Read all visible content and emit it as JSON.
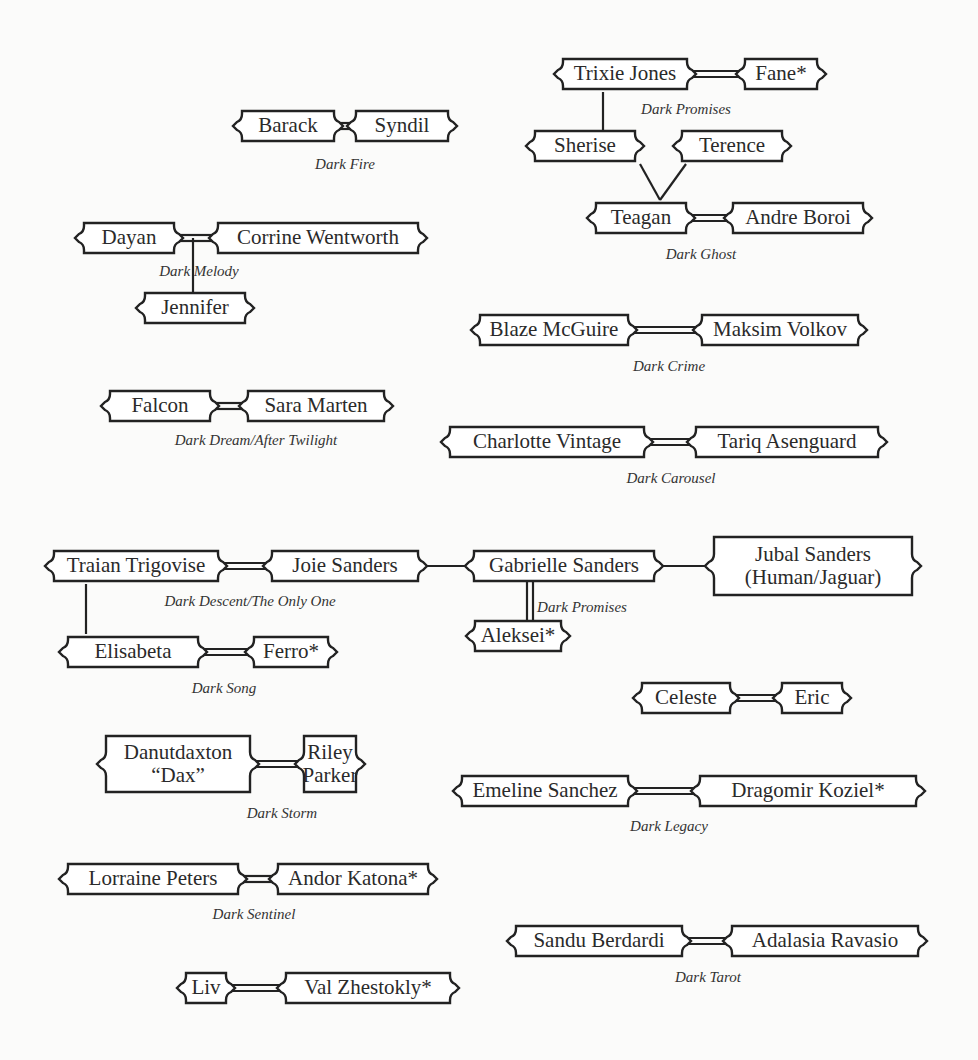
{
  "diagram": {
    "type": "family-relationship-chart",
    "colors": {
      "background": "#fbfbfa",
      "stroke": "#222222",
      "text": "#2a2a2a"
    },
    "nodes": [
      {
        "id": "barack",
        "label": "Barack",
        "x": 232,
        "y": 108,
        "w": 112,
        "h": 36
      },
      {
        "id": "syndil",
        "label": "Syndil",
        "x": 346,
        "y": 108,
        "w": 112,
        "h": 36
      },
      {
        "id": "trixie",
        "label": "Trixie Jones",
        "x": 553,
        "y": 56,
        "w": 144,
        "h": 36
      },
      {
        "id": "fane",
        "label": "Fane*",
        "x": 735,
        "y": 56,
        "w": 92,
        "h": 36
      },
      {
        "id": "sherise",
        "label": "Sherise",
        "x": 525,
        "y": 128,
        "w": 120,
        "h": 36
      },
      {
        "id": "terence",
        "label": "Terence",
        "x": 672,
        "y": 128,
        "w": 120,
        "h": 36
      },
      {
        "id": "teagan",
        "label": "Teagan",
        "x": 586,
        "y": 200,
        "w": 110,
        "h": 36
      },
      {
        "id": "andre",
        "label": "Andre Boroi",
        "x": 723,
        "y": 200,
        "w": 150,
        "h": 36
      },
      {
        "id": "dayan",
        "label": "Dayan",
        "x": 74,
        "y": 220,
        "w": 110,
        "h": 36
      },
      {
        "id": "corrine",
        "label": "Corrine Wentworth",
        "x": 208,
        "y": 220,
        "w": 220,
        "h": 36
      },
      {
        "id": "jennifer",
        "label": "Jennifer",
        "x": 135,
        "y": 290,
        "w": 120,
        "h": 36
      },
      {
        "id": "blaze",
        "label": "Blaze McGuire",
        "x": 470,
        "y": 312,
        "w": 168,
        "h": 36
      },
      {
        "id": "maksim",
        "label": "Maksim Volkov",
        "x": 692,
        "y": 312,
        "w": 176,
        "h": 36
      },
      {
        "id": "falcon",
        "label": "Falcon",
        "x": 100,
        "y": 388,
        "w": 120,
        "h": 36
      },
      {
        "id": "sara",
        "label": "Sara Marten",
        "x": 238,
        "y": 388,
        "w": 156,
        "h": 36
      },
      {
        "id": "charlotte",
        "label": "Charlotte Vintage",
        "x": 440,
        "y": 424,
        "w": 214,
        "h": 36
      },
      {
        "id": "tariq",
        "label": "Tariq Asenguard",
        "x": 686,
        "y": 424,
        "w": 202,
        "h": 36
      },
      {
        "id": "traian",
        "label": "Traian Trigovise",
        "x": 44,
        "y": 548,
        "w": 184,
        "h": 36
      },
      {
        "id": "joie",
        "label": "Joie Sanders",
        "x": 262,
        "y": 548,
        "w": 166,
        "h": 36
      },
      {
        "id": "gabrielle",
        "label": "Gabrielle Sanders",
        "x": 464,
        "y": 548,
        "w": 200,
        "h": 36
      },
      {
        "id": "jubal",
        "label": "Jubal Sanders (Human/Jaguar)",
        "lines": [
          "Jubal Sanders",
          "(Human/Jaguar)"
        ],
        "x": 704,
        "y": 534,
        "w": 218,
        "h": 64
      },
      {
        "id": "elisabeta",
        "label": "Elisabeta",
        "x": 58,
        "y": 634,
        "w": 150,
        "h": 36
      },
      {
        "id": "ferro",
        "label": "Ferro*",
        "x": 244,
        "y": 634,
        "w": 94,
        "h": 36
      },
      {
        "id": "aleksei",
        "label": "Aleksei*",
        "x": 465,
        "y": 618,
        "w": 106,
        "h": 36
      },
      {
        "id": "celeste",
        "label": "Celeste",
        "x": 632,
        "y": 680,
        "w": 108,
        "h": 36
      },
      {
        "id": "eric",
        "label": "Eric",
        "x": 772,
        "y": 680,
        "w": 80,
        "h": 36
      },
      {
        "id": "danutdaxton",
        "label": "Danutdaxton “Dax”",
        "lines": [
          "Danutdaxton",
          "“Dax”"
        ],
        "x": 96,
        "y": 733,
        "w": 164,
        "h": 62
      },
      {
        "id": "riley",
        "label": "Riley Parker",
        "lines": [
          "Riley",
          "Parker"
        ],
        "x": 294,
        "y": 733,
        "w": 72,
        "h": 62
      },
      {
        "id": "emeline",
        "label": "Emeline Sanchez",
        "x": 452,
        "y": 773,
        "w": 186,
        "h": 36
      },
      {
        "id": "dragomir",
        "label": "Dragomir Koziel*",
        "x": 690,
        "y": 773,
        "w": 236,
        "h": 36
      },
      {
        "id": "lorraine",
        "label": "Lorraine Peters",
        "x": 58,
        "y": 861,
        "w": 190,
        "h": 36
      },
      {
        "id": "andor",
        "label": "Andor Katona*",
        "x": 268,
        "y": 861,
        "w": 170,
        "h": 36
      },
      {
        "id": "sandu",
        "label": "Sandu Berdardi",
        "x": 506,
        "y": 923,
        "w": 186,
        "h": 36
      },
      {
        "id": "adalasia",
        "label": "Adalasia Ravasio",
        "x": 722,
        "y": 923,
        "w": 206,
        "h": 36
      },
      {
        "id": "liv",
        "label": "Liv",
        "x": 176,
        "y": 970,
        "w": 60,
        "h": 36
      },
      {
        "id": "val",
        "label": "Val Zhestokly*",
        "x": 276,
        "y": 970,
        "w": 184,
        "h": 36
      }
    ],
    "captions": [
      {
        "id": "cap-dark-fire",
        "text": "Dark Fire",
        "x": 345,
        "y": 156
      },
      {
        "id": "cap-dark-promises-1",
        "text": "Dark Promises",
        "x": 686,
        "y": 101
      },
      {
        "id": "cap-dark-ghost",
        "text": "Dark Ghost",
        "x": 701,
        "y": 246
      },
      {
        "id": "cap-dark-melody",
        "text": "Dark Melody",
        "x": 199,
        "y": 263
      },
      {
        "id": "cap-dark-crime",
        "text": "Dark Crime",
        "x": 669,
        "y": 358
      },
      {
        "id": "cap-dark-dream",
        "text": "Dark Dream/After Twilight",
        "x": 256,
        "y": 432
      },
      {
        "id": "cap-dark-carousel",
        "text": "Dark Carousel",
        "x": 671,
        "y": 470
      },
      {
        "id": "cap-dark-descent",
        "text": "Dark Descent/The Only One",
        "x": 250,
        "y": 593
      },
      {
        "id": "cap-dark-promises-2",
        "text": "Dark Promises",
        "x": 582,
        "y": 599
      },
      {
        "id": "cap-dark-song",
        "text": "Dark Song",
        "x": 224,
        "y": 680
      },
      {
        "id": "cap-dark-storm",
        "text": "Dark Storm",
        "x": 282,
        "y": 805
      },
      {
        "id": "cap-dark-legacy",
        "text": "Dark Legacy",
        "x": 669,
        "y": 818
      },
      {
        "id": "cap-dark-sentinel",
        "text": "Dark Sentinel",
        "x": 254,
        "y": 906
      },
      {
        "id": "cap-dark-tarot",
        "text": "Dark Tarot",
        "x": 708,
        "y": 969
      }
    ],
    "marriages": [
      [
        "barack",
        "syndil"
      ],
      [
        "trixie",
        "fane"
      ],
      [
        "teagan",
        "andre"
      ],
      [
        "dayan",
        "corrine"
      ],
      [
        "blaze",
        "maksim"
      ],
      [
        "falcon",
        "sara"
      ],
      [
        "charlotte",
        "tariq"
      ],
      [
        "traian",
        "joie"
      ],
      [
        "elisabeta",
        "ferro"
      ],
      [
        "celeste",
        "eric"
      ],
      [
        "danutdaxton",
        "riley"
      ],
      [
        "emeline",
        "dragomir"
      ],
      [
        "lorraine",
        "andor"
      ],
      [
        "sandu",
        "adalasia"
      ],
      [
        "liv",
        "val"
      ],
      [
        "gabrielle",
        "aleksei"
      ]
    ],
    "lineage": [
      [
        "trixie",
        "sherise"
      ],
      [
        "sherise",
        "teagan"
      ],
      [
        "terence",
        "teagan"
      ],
      [
        "dayan-corrine",
        "jennifer"
      ],
      [
        "traian",
        "elisabeta"
      ],
      [
        "joie",
        "gabrielle"
      ],
      [
        "gabrielle",
        "jubal"
      ]
    ]
  }
}
